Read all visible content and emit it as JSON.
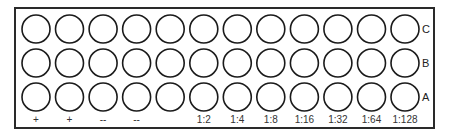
{
  "diagram": {
    "title": "",
    "plate": {
      "rows": [
        "C",
        "B",
        "A"
      ],
      "columns": 12,
      "column_labels": [
        "+",
        "+",
        "--",
        "--",
        "",
        "1:2",
        "1:4",
        "1:8",
        "1:16",
        "1:32",
        "1:64",
        "1:128"
      ]
    },
    "colors": {
      "outline": "#1a1a1a",
      "background": "#ffffff",
      "text": "#333333"
    }
  }
}
